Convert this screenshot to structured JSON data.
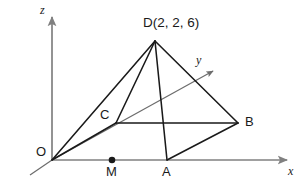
{
  "figure": {
    "type": "3d-coordinate-diagram",
    "background_color": "#ffffff",
    "axis_color": "#808080",
    "edge_color": "#1a1a1a",
    "label_color": "#1a1a1a",
    "axes": [
      {
        "id": "z",
        "label": "z",
        "label_x": 40,
        "label_y": 4,
        "direction": "vertical-up"
      },
      {
        "id": "y",
        "label": "y",
        "label_x": 196,
        "label_y": 54,
        "direction": "diagonal-up-right"
      },
      {
        "id": "x",
        "label": "x",
        "label_x": 288,
        "label_y": 165,
        "direction": "horizontal-right"
      }
    ],
    "points": [
      {
        "id": "O",
        "label": "O",
        "x": 52,
        "y": 160,
        "label_x": 36,
        "label_y": 145,
        "marker": "none"
      },
      {
        "id": "M",
        "label": "M",
        "x": 112,
        "y": 160,
        "label_x": 106,
        "label_y": 165,
        "marker": "dot"
      },
      {
        "id": "A",
        "label": "A",
        "x": 167,
        "y": 160,
        "label_x": 162,
        "label_y": 165,
        "marker": "none"
      },
      {
        "id": "B",
        "label": "B",
        "x": 238,
        "y": 123,
        "label_x": 245,
        "label_y": 115,
        "marker": "none"
      },
      {
        "id": "C",
        "label": "C",
        "x": 116,
        "y": 123,
        "label_x": 100,
        "label_y": 108,
        "marker": "none"
      },
      {
        "id": "D",
        "label": "D(2, 2, 6)",
        "x": 155,
        "y": 41,
        "label_x": 143,
        "label_y": 16,
        "marker": "none"
      }
    ],
    "edges": [
      {
        "from": "O",
        "to": "D"
      },
      {
        "from": "O",
        "to": "C"
      },
      {
        "from": "D",
        "to": "C"
      },
      {
        "from": "D",
        "to": "A"
      },
      {
        "from": "D",
        "to": "B"
      },
      {
        "from": "C",
        "to": "B"
      },
      {
        "from": "A",
        "to": "B"
      }
    ],
    "apex_label": "D(2, 2, 6)",
    "apex_coordinates": [
      2,
      2,
      6
    ]
  }
}
